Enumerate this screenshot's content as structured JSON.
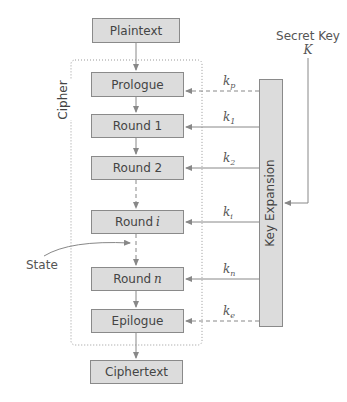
{
  "diagram": {
    "blocks": {
      "plaintext": "Plaintext",
      "prologue": "Prologue",
      "round1": "Round 1",
      "round2": "Round 2",
      "roundi_prefix": "Round",
      "roundi_var": "i",
      "roundn_prefix": "Round",
      "roundn_var": "n",
      "epilogue": "Epilogue",
      "ciphertext": "Ciphertext"
    },
    "cipher_label": "Cipher",
    "key_expansion_label": "Key Expansion",
    "secret_key": {
      "label": "Secret Key",
      "symbol": "K"
    },
    "state_label": "State",
    "subkeys": {
      "kp": {
        "base": "k",
        "sub": "p"
      },
      "k1": {
        "base": "k",
        "sub": "1"
      },
      "k2": {
        "base": "k",
        "sub": "2"
      },
      "ki": {
        "base": "k",
        "sub": "i"
      },
      "kn": {
        "base": "k",
        "sub": "n"
      },
      "ke": {
        "base": "k",
        "sub": "e"
      }
    },
    "colors": {
      "block_fill": "#dcdcdc",
      "block_border": "#8a8a8a",
      "line": "#8a8a8a"
    }
  }
}
